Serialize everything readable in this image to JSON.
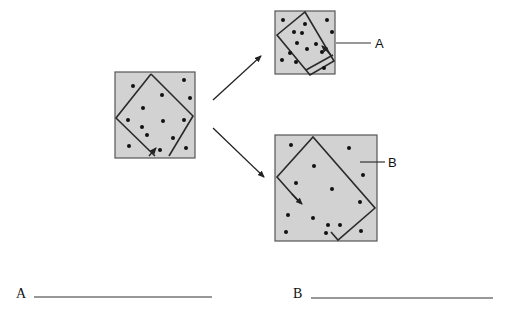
{
  "diagram": {
    "original": {
      "square": {
        "x": 115,
        "y": 72,
        "w": 80,
        "h": 86
      },
      "cell_outline": "M151,74 L193,116 L172,155 L157,151 L137,155 L116,118 Z",
      "dots": [
        [
          133,
          86
        ],
        [
          184,
          80
        ],
        [
          162,
          95
        ],
        [
          190,
          98
        ],
        [
          143,
          108
        ],
        [
          128,
          120
        ],
        [
          163,
          121
        ],
        [
          184,
          120
        ],
        [
          142,
          127
        ],
        [
          147,
          135
        ],
        [
          173,
          138
        ],
        [
          129,
          146
        ],
        [
          186,
          148
        ],
        [
          160,
          150
        ]
      ],
      "arrow_tip": [
        154,
        146
      ],
      "arrow_tail": [
        150,
        154
      ]
    },
    "shrunk": {
      "label": "A",
      "square": {
        "x": 275,
        "y": 11,
        "w": 60,
        "h": 63
      },
      "cell_outline": "M305,13 L334,62 L310,75 L304,73 L277,35 Z M307,72 L334,56",
      "dots": [
        [
          283,
          20
        ],
        [
          305,
          24
        ],
        [
          327,
          20
        ],
        [
          294,
          32
        ],
        [
          302,
          33
        ],
        [
          332,
          32
        ],
        [
          297,
          43
        ],
        [
          316,
          44
        ],
        [
          290,
          53
        ],
        [
          307,
          49
        ],
        [
          322,
          52
        ],
        [
          282,
          60
        ],
        [
          296,
          62
        ],
        [
          324,
          68
        ]
      ],
      "leader_start": [
        335,
        42
      ],
      "leader_end": [
        370,
        42
      ],
      "label_pos": [
        374,
        47
      ]
    },
    "swollen": {
      "label": "B",
      "square": {
        "x": 275,
        "y": 135,
        "w": 102,
        "h": 106
      },
      "cell_outline": "M313,137 L375,208 L338,240 L331,232 M277,177 L302,202",
      "dots": [
        [
          291,
          145
        ],
        [
          349,
          148
        ],
        [
          314,
          166
        ],
        [
          363,
          175
        ],
        [
          296,
          183
        ],
        [
          332,
          189
        ],
        [
          360,
          202
        ],
        [
          288,
          215
        ],
        [
          313,
          218
        ],
        [
          340,
          225
        ],
        [
          286,
          232
        ],
        [
          326,
          233
        ],
        [
          328,
          225
        ],
        [
          361,
          231
        ]
      ],
      "leader_start": [
        360,
        162
      ],
      "leader_end": [
        384,
        162
      ],
      "label_pos": [
        388,
        167
      ]
    },
    "arrows": [
      {
        "name": "to-shrunk",
        "x1": 213,
        "y1": 100,
        "x2": 260,
        "y2": 57
      },
      {
        "name": "to-swollen",
        "x1": 213,
        "y1": 128,
        "x2": 263,
        "y2": 176
      }
    ]
  },
  "answers": {
    "a_label": "A",
    "b_label": "B",
    "a_line": {
      "x1": 34,
      "x2": 212,
      "y": 297
    },
    "b_line": {
      "x1": 311,
      "x2": 493,
      "y": 298
    }
  }
}
